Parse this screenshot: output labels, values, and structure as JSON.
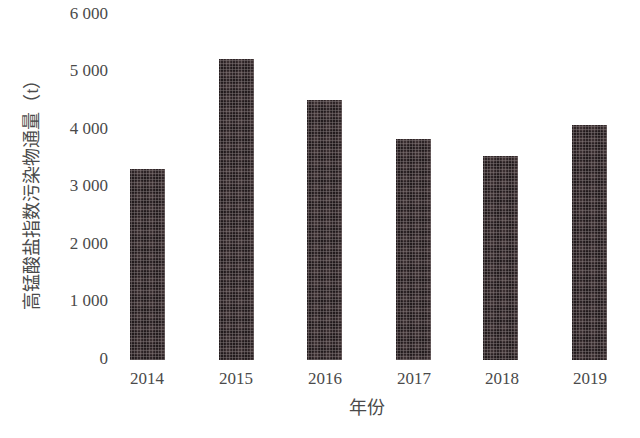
{
  "chart_data": {
    "type": "bar",
    "title": "",
    "xlabel": "年份",
    "ylabel": "高锰酸盐指数污染物通量（t）",
    "categories": [
      "2014",
      "2015",
      "2016",
      "2017",
      "2018",
      "2019"
    ],
    "values": [
      3320,
      5230,
      4520,
      3840,
      3550,
      4090
    ],
    "ylim": [
      0,
      6000
    ],
    "yticks": [
      "0",
      "1 000",
      "2 000",
      "3 000",
      "4 000",
      "5 000",
      "6 000"
    ],
    "grid": false,
    "legend": null,
    "bar_color": "#3b2f31"
  }
}
